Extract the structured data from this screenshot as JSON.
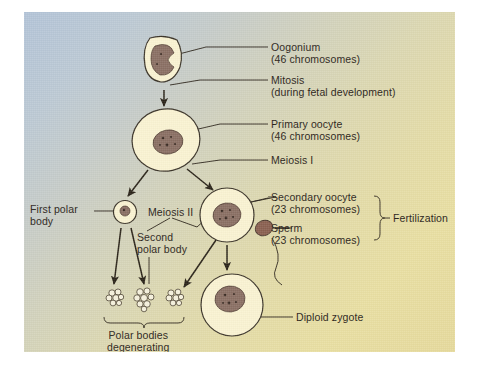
{
  "figure": {
    "background": {
      "top_left_color": "#b3c4d8",
      "bottom_right_color": "#e9dfa2",
      "page_color": "#ffffff"
    },
    "palette": {
      "cytoplasm": "#faf3d2",
      "cytoplasm_edge": "#3a3328",
      "nucleus": "#8a6f63",
      "nucleus_speckle": "#4a382e",
      "sperm": "#8a6050",
      "line": "#2a2318",
      "text": "#2a2318"
    }
  },
  "labels": {
    "oogonium": {
      "line1": "Oogonium",
      "line2": "(46 chromosomes)"
    },
    "mitosis": {
      "line1": "Mitosis",
      "line2": "(during fetal development)"
    },
    "primary_oocyte": {
      "line1": "Primary oocyte",
      "line2": "(46 chromosomes)"
    },
    "meiosis_i": {
      "line1": "Meiosis I"
    },
    "secondary_oocyte": {
      "line1": "Secondary oocyte",
      "line2": "(23 chromosomes)"
    },
    "sperm": {
      "line1": "Sperm",
      "line2": "(23 chromosomes)"
    },
    "fertilization": {
      "line1": "Fertilization"
    },
    "first_polar_body": {
      "line1": "First polar",
      "line2": "body"
    },
    "meiosis_ii": {
      "line1": "Meiosis II"
    },
    "second_polar_body": {
      "line1": "Second",
      "line2": "polar body"
    },
    "polar_bodies_degenerating": {
      "line1": "Polar bodies",
      "line2": "degenerating"
    },
    "diploid_zygote": {
      "line1": "Diploid zygote"
    }
  },
  "cells": [
    {
      "name": "oogonium",
      "shape": "rounded-square",
      "cx": 140,
      "cy": 48,
      "chromosomes": "46"
    },
    {
      "name": "primary-oocyte",
      "shape": "oval",
      "cx": 142,
      "cy": 128,
      "chromosomes": "46"
    },
    {
      "name": "first-polar-body",
      "shape": "circle",
      "cx": 101,
      "cy": 200,
      "chromosomes": "23"
    },
    {
      "name": "secondary-oocyte",
      "shape": "circle",
      "cx": 203,
      "cy": 203,
      "chromosomes": "23"
    },
    {
      "name": "sperm",
      "shape": "sperm",
      "cx": 243,
      "cy": 218,
      "chromosomes": "23"
    },
    {
      "name": "diploid-zygote",
      "shape": "circle",
      "cx": 208,
      "cy": 293,
      "chromosomes": "46"
    }
  ],
  "degenerating_polar_bodies": [
    {
      "name": "polar-body-blob-1",
      "cx": 91,
      "cy": 285
    },
    {
      "name": "polar-body-blob-2",
      "cx": 121,
      "cy": 288
    },
    {
      "name": "polar-body-blob-3",
      "cx": 151,
      "cy": 285
    }
  ]
}
